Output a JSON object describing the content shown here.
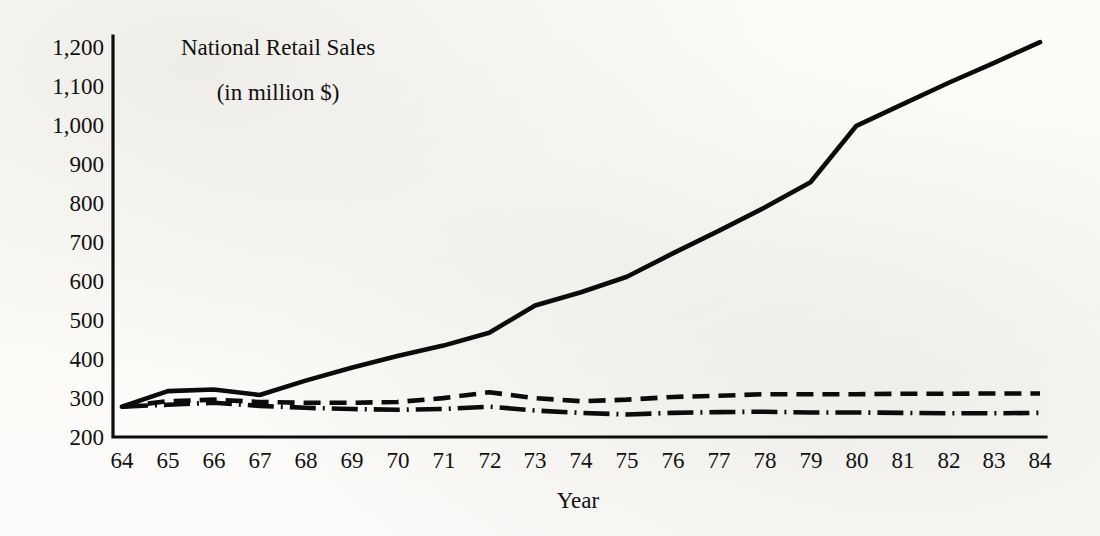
{
  "chart_data": {
    "type": "line",
    "title": "National Retail Sales",
    "subtitle": "(in million $)",
    "xlabel": "Year",
    "ylabel": "",
    "unit_note": "(in million $)",
    "grid": false,
    "legend_position": "none",
    "xlim": [
      64,
      84
    ],
    "ylim": [
      200,
      1200
    ],
    "x": [
      64,
      65,
      66,
      67,
      68,
      69,
      70,
      71,
      72,
      73,
      74,
      75,
      76,
      77,
      78,
      79,
      80,
      81,
      82,
      83,
      84
    ],
    "xtick_labels": [
      "64",
      "65",
      "66",
      "67",
      "68",
      "69",
      "70",
      "71",
      "72",
      "73",
      "74",
      "75",
      "76",
      "77",
      "78",
      "79",
      "80",
      "81",
      "82",
      "83",
      "84"
    ],
    "ytick_labels": [
      "1,200",
      "1,100",
      "1,000",
      "900",
      "800",
      "700",
      "600",
      "500",
      "400",
      "300",
      "200"
    ],
    "ytick_values": [
      1200,
      1100,
      1000,
      900,
      800,
      700,
      600,
      500,
      400,
      300,
      200
    ],
    "series": [
      {
        "name": "Total national retail sales",
        "style": "solid",
        "values": [
          278,
          318,
          322,
          308,
          345,
          378,
          408,
          435,
          468,
          538,
          572,
          612,
          672,
          730,
          790,
          855,
          1000,
          1055,
          1110,
          1162,
          1215
        ]
      },
      {
        "name": "Series B",
        "style": "dashed",
        "values": [
          278,
          292,
          296,
          290,
          288,
          288,
          290,
          300,
          315,
          300,
          292,
          296,
          303,
          306,
          310,
          310,
          310,
          311,
          311,
          312,
          312
        ]
      },
      {
        "name": "Series C",
        "style": "dash-dot",
        "values": [
          278,
          283,
          288,
          280,
          275,
          272,
          270,
          272,
          278,
          268,
          262,
          258,
          262,
          264,
          265,
          263,
          263,
          262,
          261,
          261,
          262
        ]
      }
    ]
  },
  "colors": {
    "ink": "#0b0b0b",
    "paper": "#fdfdfb",
    "axis": "#0d0d0d"
  }
}
